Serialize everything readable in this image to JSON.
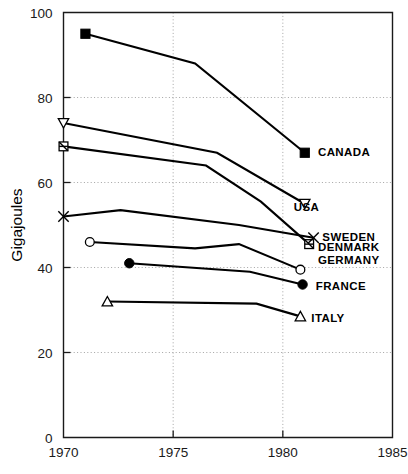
{
  "chart_data": {
    "type": "line",
    "title": "",
    "subtitle": "",
    "xlabel": "",
    "ylabel": "Gigajoules",
    "xlim": [
      1970,
      1985
    ],
    "ylim": [
      0,
      100
    ],
    "xticks": [
      1970,
      1975,
      1980,
      1985
    ],
    "yticks": [
      0,
      20,
      40,
      60,
      80,
      100
    ],
    "xtick_labels": [
      "1970",
      "1975",
      "1980",
      "1985"
    ],
    "ytick_labels": [
      "0",
      "20",
      "40",
      "60",
      "80",
      "100"
    ],
    "grid": "dotted gridlines at major x and y ticks",
    "legend_position": "inline labels at right end of each line",
    "series": [
      {
        "name": "CANADA",
        "label": "CANADA",
        "marker": "filled-square",
        "color": "#000000",
        "x": [
          1971.0,
          1976.0,
          1981.0
        ],
        "y": [
          95.0,
          88.0,
          67.0
        ],
        "label_x": 1981.6,
        "label_y": 67.0
      },
      {
        "name": "USA",
        "label": "USA",
        "marker": "open-triangle-down",
        "color": "#000000",
        "x": [
          1970.0,
          1977.0,
          1981.0
        ],
        "y": [
          74.0,
          67.0,
          55.0
        ],
        "label_x": 1980.5,
        "label_y": 54.0
      },
      {
        "name": "DENMARK",
        "label": "DENMARK",
        "marker": "open-square-crossed",
        "color": "#000000",
        "x": [
          1970.0,
          1976.5,
          1979.0,
          1981.2
        ],
        "y": [
          68.5,
          64.0,
          55.5,
          45.5
        ],
        "label_x": 1981.6,
        "label_y": 44.5
      },
      {
        "name": "SWEDEN",
        "label": "SWEDEN",
        "marker": "x-cross",
        "color": "#000000",
        "x": [
          1970.0,
          1972.6,
          1978.0,
          1981.4
        ],
        "y": [
          52.0,
          53.5,
          50.0,
          47.0
        ],
        "label_x": 1981.8,
        "label_y": 47.0
      },
      {
        "name": "GERMANY",
        "label": "GERMANY",
        "marker": "open-circle",
        "color": "#000000",
        "x": [
          1971.2,
          1976.0,
          1978.0,
          1980.8
        ],
        "y": [
          46.0,
          44.5,
          45.5,
          39.5
        ],
        "label_x": 1981.6,
        "label_y": 41.5
      },
      {
        "name": "FRANCE",
        "label": "FRANCE",
        "marker": "filled-circle",
        "color": "#000000",
        "x": [
          1973.0,
          1978.5,
          1980.9
        ],
        "y": [
          41.0,
          39.0,
          36.0
        ],
        "label_x": 1981.5,
        "label_y": 35.5
      },
      {
        "name": "ITALY",
        "label": "ITALY",
        "marker": "open-triangle-up",
        "color": "#000000",
        "x": [
          1972.0,
          1978.8,
          1980.8
        ],
        "y": [
          32.0,
          31.5,
          28.5
        ],
        "label_x": 1981.3,
        "label_y": 28.0
      }
    ]
  }
}
